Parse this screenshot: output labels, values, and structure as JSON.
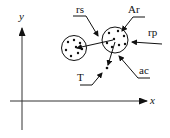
{
  "diagram": {
    "axes": {
      "x_label": "x",
      "y_label": "y"
    },
    "labels": {
      "rs": "rs",
      "ar": "Ar",
      "rp": "rp",
      "ac": "ac",
      "t": "T"
    },
    "colors": {
      "stroke": "#111111",
      "background": "#ffffff"
    }
  }
}
